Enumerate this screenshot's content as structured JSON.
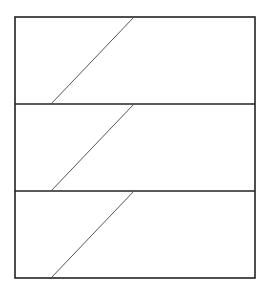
{
  "canvas": {
    "width": 271,
    "height": 299,
    "background": "#ffffff"
  },
  "diagram": {
    "outer_rect": {
      "x": 15,
      "y": 17,
      "width": 240,
      "height": 261
    },
    "stroke_color": "#222222",
    "line_color": "#555555",
    "dividers_y": [
      104,
      191
    ],
    "bands": [
      {
        "index": 1,
        "top": 17,
        "bottom": 104,
        "diagonal": {
          "x1": 51,
          "y1": 104,
          "x2": 134,
          "y2": 17
        }
      },
      {
        "index": 2,
        "top": 104,
        "bottom": 191,
        "diagonal": {
          "x1": 51,
          "y1": 191,
          "x2": 134,
          "y2": 104
        }
      },
      {
        "index": 3,
        "top": 191,
        "bottom": 278,
        "diagonal": {
          "x1": 51,
          "y1": 278,
          "x2": 134,
          "y2": 191
        }
      }
    ]
  }
}
